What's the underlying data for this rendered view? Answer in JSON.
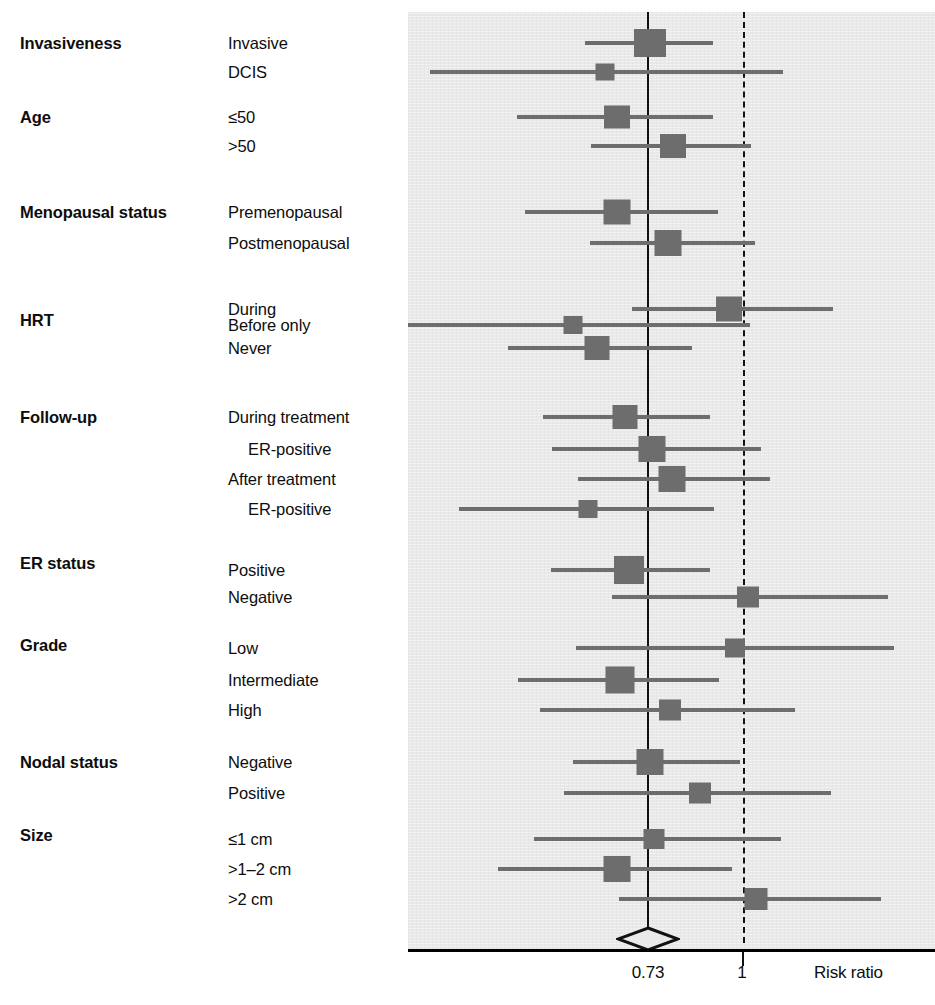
{
  "figure": {
    "type": "forest-plot",
    "axis": {
      "label": "Risk ratio",
      "ticks": [
        {
          "text": "0.73",
          "value": 0.73
        },
        {
          "text": "1",
          "value": 1
        }
      ],
      "reference_line_solid_value": 0.73,
      "reference_line_dashed_value": 1,
      "summary": {
        "estimate": 0.73,
        "shape": "diamond"
      }
    }
  },
  "chart_data": {
    "type": "forest",
    "title": "",
    "xlabel": "Risk ratio",
    "ylabel": "",
    "xscale": "log",
    "xticks": [
      0.73,
      1
    ],
    "xtick_labels": [
      "0.73",
      "1"
    ],
    "reference_lines": [
      {
        "value": 0.73,
        "style": "solid"
      },
      {
        "value": 1,
        "style": "dashed"
      }
    ],
    "summary_diamond": {
      "estimate": 0.73
    },
    "legend": "",
    "grid": false,
    "groups": [
      {
        "name": "Invasiveness",
        "rows": [
          {
            "label": "Invasive",
            "indent": false,
            "estimate": 0.76,
            "ci_low": 0.64,
            "ci_high": 0.91,
            "weight": "large"
          },
          {
            "label": "DCIS",
            "indent": false,
            "estimate": 0.58,
            "ci_low": 0.21,
            "ci_high": 1.55,
            "weight": "small"
          }
        ]
      },
      {
        "name": "Age",
        "rows": [
          {
            "label": "≤50",
            "indent": false,
            "estimate": 0.7,
            "ci_low": 0.55,
            "ci_high": 0.93,
            "weight": "medium"
          },
          {
            "label": ">50",
            "indent": false,
            "estimate": 0.82,
            "ci_low": 0.64,
            "ci_high": 1.0,
            "weight": "medium"
          }
        ]
      },
      {
        "name": "Menopausal status",
        "rows": [
          {
            "label": "Premenopausal",
            "indent": false,
            "estimate": 0.69,
            "ci_low": 0.53,
            "ci_high": 0.9,
            "weight": "medium"
          },
          {
            "label": "Postmenopausal",
            "indent": false,
            "estimate": 0.79,
            "ci_low": 0.62,
            "ci_high": 1.01,
            "weight": "medium"
          }
        ]
      },
      {
        "name": "HRT",
        "rows": [
          {
            "label": "During",
            "indent": false,
            "estimate": 0.97,
            "ci_low": 0.76,
            "ci_high": 1.3,
            "weight": "medium"
          },
          {
            "label": "Before only",
            "indent": false,
            "estimate": 0.63,
            "ci_low": 0.2,
            "ci_high": 1.0,
            "weight": "small"
          },
          {
            "label": "Never",
            "indent": false,
            "estimate": 0.66,
            "ci_low": 0.52,
            "ci_high": 0.87,
            "weight": "medium"
          }
        ]
      },
      {
        "name": "Follow-up",
        "rows": [
          {
            "label": "During treatment",
            "indent": false,
            "estimate": 0.72,
            "ci_low": 0.57,
            "ci_high": 0.92,
            "weight": "medium"
          },
          {
            "label": "ER-positive",
            "indent": true,
            "estimate": 0.75,
            "ci_low": 0.58,
            "ci_high": 1.02,
            "weight": "medium"
          },
          {
            "label": "After treatment",
            "indent": false,
            "estimate": 0.83,
            "ci_low": 0.61,
            "ci_high": 1.04,
            "weight": "medium"
          },
          {
            "label": "ER-positive",
            "indent": true,
            "estimate": 0.61,
            "ci_low": 0.3,
            "ci_high": 0.92,
            "weight": "small"
          }
        ]
      },
      {
        "name": "ER status",
        "rows": [
          {
            "label": "Positive",
            "indent": false,
            "estimate": 0.72,
            "ci_low": 0.54,
            "ci_high": 0.92,
            "weight": "large"
          },
          {
            "label": "Negative",
            "indent": false,
            "estimate": 1.0,
            "ci_low": 0.68,
            "ci_high": 1.45,
            "weight": "medium"
          }
        ]
      },
      {
        "name": "Grade",
        "rows": [
          {
            "label": "Low",
            "indent": false,
            "estimate": 0.96,
            "ci_low": 0.59,
            "ci_high": 1.49,
            "weight": "small"
          },
          {
            "label": "Intermediate",
            "indent": false,
            "estimate": 0.7,
            "ci_low": 0.55,
            "ci_high": 0.92,
            "weight": "large"
          },
          {
            "label": "High",
            "indent": false,
            "estimate": 0.81,
            "ci_low": 0.61,
            "ci_high": 1.09,
            "weight": "medium"
          }
        ]
      },
      {
        "name": "Nodal status",
        "rows": [
          {
            "label": "Negative",
            "indent": false,
            "estimate": 0.76,
            "ci_low": 0.6,
            "ci_high": 0.97,
            "weight": "large"
          },
          {
            "label": "Positive",
            "indent": false,
            "estimate": 0.88,
            "ci_low": 0.58,
            "ci_high": 1.15,
            "weight": "medium"
          }
        ]
      },
      {
        "name": "Size",
        "rows": [
          {
            "label": "≤1 cm",
            "indent": false,
            "estimate": 0.78,
            "ci_low": 0.55,
            "ci_high": 1.04,
            "weight": "medium"
          },
          {
            "label": ">1–2 cm",
            "indent": false,
            "estimate": 0.69,
            "ci_low": 0.5,
            "ci_high": 0.94,
            "weight": "large"
          },
          {
            "label": ">2 cm",
            "indent": false,
            "estimate": 1.02,
            "ci_low": 0.62,
            "ci_high": 1.38,
            "weight": "medium"
          }
        ]
      }
    ]
  },
  "geometry": {
    "rows": [
      {
        "y": 43,
        "group": "Invasiveness",
        "group_y": 43,
        "label": "Invasive",
        "indent": false,
        "ci_x1": 585,
        "ci_x2": 713,
        "box_cx": 650,
        "box_w": 32,
        "box_h": 28
      },
      {
        "y": 72,
        "group": null,
        "group_y": null,
        "label": "DCIS",
        "indent": false,
        "ci_x1": 430,
        "ci_x2": 783,
        "box_cx": 605,
        "box_w": 19,
        "box_h": 17
      },
      {
        "y": 117,
        "group": "Age",
        "group_y": 117,
        "label": "≤50",
        "indent": false,
        "ci_x1": 517,
        "ci_x2": 713,
        "box_cx": 617,
        "box_w": 26,
        "box_h": 23
      },
      {
        "y": 146,
        "group": null,
        "group_y": null,
        "label": ">50",
        "indent": false,
        "ci_x1": 591,
        "ci_x2": 751,
        "box_cx": 673,
        "box_w": 26,
        "box_h": 24
      },
      {
        "y": 212,
        "group": "Menopausal status",
        "group_y": 212,
        "label": "Premenopausal",
        "indent": false,
        "ci_x1": 525,
        "ci_x2": 718,
        "box_cx": 617,
        "box_w": 27,
        "box_h": 25
      },
      {
        "y": 243,
        "group": null,
        "group_y": null,
        "label": "Postmenopausal",
        "indent": false,
        "ci_x1": 590,
        "ci_x2": 755,
        "box_cx": 668,
        "box_w": 27,
        "box_h": 26
      },
      {
        "y": 309,
        "group": "HRT",
        "group_y": 320,
        "label": "During",
        "indent": false,
        "ci_x1": 632,
        "ci_x2": 833,
        "box_cx": 729,
        "box_w": 26,
        "box_h": 25
      },
      {
        "y": 325,
        "group": null,
        "group_y": null,
        "label": "Before only",
        "indent": false,
        "ci_x1": 408,
        "ci_x2": 750,
        "box_cx": 573,
        "box_w": 19,
        "box_h": 18
      },
      {
        "y": 348,
        "group": null,
        "group_y": null,
        "label": "Never",
        "indent": false,
        "ci_x1": 508,
        "ci_x2": 692,
        "box_cx": 597,
        "box_w": 25,
        "box_h": 24
      },
      {
        "y": 417,
        "group": "Follow-up",
        "group_y": 417,
        "label": "During treatment",
        "indent": false,
        "ci_x1": 543,
        "ci_x2": 710,
        "box_cx": 625,
        "box_w": 25,
        "box_h": 24
      },
      {
        "y": 449,
        "group": null,
        "group_y": null,
        "label": "ER-positive",
        "indent": true,
        "ci_x1": 552,
        "ci_x2": 761,
        "box_cx": 652,
        "box_w": 27,
        "box_h": 26
      },
      {
        "y": 479,
        "group": null,
        "group_y": null,
        "label": "After treatment",
        "indent": false,
        "ci_x1": 578,
        "ci_x2": 770,
        "box_cx": 672,
        "box_w": 27,
        "box_h": 26
      },
      {
        "y": 509,
        "group": null,
        "group_y": null,
        "label": "ER-positive",
        "indent": true,
        "ci_x1": 459,
        "ci_x2": 714,
        "box_cx": 588,
        "box_w": 19,
        "box_h": 18
      },
      {
        "y": 570,
        "group": "ER status",
        "group_y": 563,
        "label": "Positive",
        "indent": false,
        "ci_x1": 551,
        "ci_x2": 710,
        "box_cx": 629,
        "box_w": 30,
        "box_h": 28
      },
      {
        "y": 597,
        "group": null,
        "group_y": null,
        "label": "Negative",
        "indent": false,
        "ci_x1": 612,
        "ci_x2": 888,
        "box_cx": 748,
        "box_w": 22,
        "box_h": 21
      },
      {
        "y": 648,
        "group": "Grade",
        "group_y": 645,
        "label": "Low",
        "indent": false,
        "ci_x1": 576,
        "ci_x2": 894,
        "box_cx": 735,
        "box_w": 20,
        "box_h": 19
      },
      {
        "y": 680,
        "group": null,
        "group_y": null,
        "label": "Intermediate",
        "indent": false,
        "ci_x1": 518,
        "ci_x2": 719,
        "box_cx": 620,
        "box_w": 29,
        "box_h": 27
      },
      {
        "y": 710,
        "group": null,
        "group_y": null,
        "label": "High",
        "indent": false,
        "ci_x1": 540,
        "ci_x2": 795,
        "box_cx": 670,
        "box_w": 22,
        "box_h": 21
      },
      {
        "y": 762,
        "group": "Nodal status",
        "group_y": 762,
        "label": "Negative",
        "indent": false,
        "ci_x1": 573,
        "ci_x2": 740,
        "box_cx": 650,
        "box_w": 27,
        "box_h": 26
      },
      {
        "y": 793,
        "group": null,
        "group_y": null,
        "label": "Positive",
        "indent": false,
        "ci_x1": 564,
        "ci_x2": 831,
        "box_cx": 700,
        "box_w": 22,
        "box_h": 21
      },
      {
        "y": 839,
        "group": "Size",
        "group_y": 835,
        "label": "≤1 cm",
        "indent": false,
        "ci_x1": 534,
        "ci_x2": 781,
        "box_cx": 654,
        "box_w": 21,
        "box_h": 20
      },
      {
        "y": 869,
        "group": null,
        "group_y": null,
        "label": ">1–2 cm",
        "indent": false,
        "ci_x1": 498,
        "ci_x2": 732,
        "box_cx": 617,
        "box_w": 27,
        "box_h": 26
      },
      {
        "y": 899,
        "group": null,
        "group_y": null,
        "label": ">2 cm",
        "indent": false,
        "ci_x1": 619,
        "ci_x2": 881,
        "box_cx": 756,
        "box_w": 23,
        "box_h": 22
      }
    ]
  },
  "colors": {
    "panel_bg": "#e9e9e9",
    "marker": "#6d6d6d",
    "line": "#111111",
    "text": "#0d0d0d"
  },
  "axis_labels": {
    "tick_073": "0.73",
    "tick_1": "1",
    "axis_title": "Risk ratio"
  }
}
